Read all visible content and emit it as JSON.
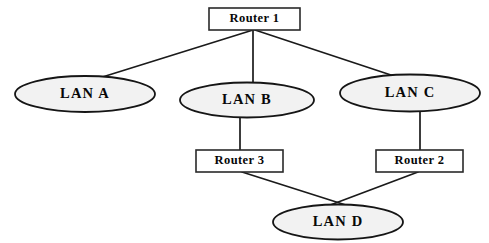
{
  "diagram": {
    "background_color": "#ffffff",
    "line_color": "#1a1a1a",
    "ellipse_fill": "#f2f2f2",
    "ellipse_stroke": "#151515",
    "box_fill": "#ffffff",
    "box_stroke": "#2a2a2a",
    "text_color": "#080808"
  },
  "nodes": {
    "router1": {
      "label": "Router  1",
      "shape": "rectangle",
      "x": 209,
      "y": 8,
      "width": 91,
      "height": 22,
      "cx": 254.5,
      "cy": 19
    },
    "router2": {
      "label": "Router  2",
      "shape": "rectangle",
      "x": 376,
      "y": 150,
      "width": 87,
      "height": 22,
      "cx": 419.5,
      "cy": 161
    },
    "router3": {
      "label": "Router  3",
      "shape": "rectangle",
      "x": 196,
      "y": 150,
      "width": 87,
      "height": 22,
      "cx": 239.5,
      "cy": 161
    },
    "lanA": {
      "label": "LAN A",
      "shape": "ellipse",
      "cx": 85,
      "cy": 94,
      "rx": 70,
      "ry": 18
    },
    "lanB": {
      "label": "LAN B",
      "shape": "ellipse",
      "cx": 247,
      "cy": 100,
      "rx": 67,
      "ry": 17.5
    },
    "lanC": {
      "label": "LAN C",
      "shape": "ellipse",
      "cx": 410,
      "cy": 93,
      "rx": 70,
      "ry": 18.5
    },
    "lanD": {
      "label": "LAN D",
      "shape": "ellipse",
      "cx": 338,
      "cy": 222,
      "rx": 65,
      "ry": 17.5
    }
  },
  "edges": [
    {
      "id": "router1-lanA",
      "from": "Router  1",
      "to": "LAN A",
      "x1": 253,
      "y1": 30,
      "x2": 96,
      "y2": 79
    },
    {
      "id": "router1-lanB",
      "from": "Router  1",
      "to": "LAN B",
      "x1": 253,
      "y1": 30,
      "x2": 253,
      "y2": 85
    },
    {
      "id": "router1-lanC",
      "from": "Router  1",
      "to": "LAN C",
      "x1": 255,
      "y1": 30,
      "x2": 400,
      "y2": 78
    },
    {
      "id": "lanB-router3",
      "from": "LAN B",
      "to": "Router  3",
      "x1": 240,
      "y1": 116,
      "x2": 240,
      "y2": 150
    },
    {
      "id": "lanC-router2",
      "from": "LAN C",
      "to": "Router  2",
      "x1": 420,
      "y1": 111,
      "x2": 420,
      "y2": 150
    },
    {
      "id": "router3-lanD",
      "from": "Router  3",
      "to": "LAN D",
      "x1": 242,
      "y1": 172,
      "x2": 352,
      "y2": 207
    },
    {
      "id": "router2-lanD",
      "from": "Router  2",
      "to": "LAN D",
      "x1": 418,
      "y1": 172,
      "x2": 325,
      "y2": 207
    }
  ]
}
